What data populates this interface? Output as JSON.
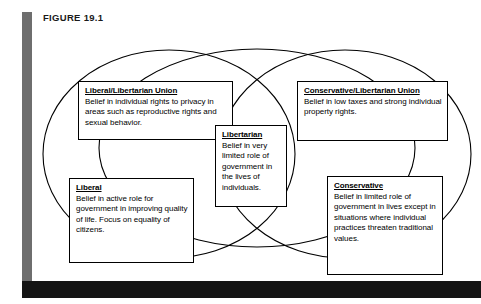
{
  "plate": {
    "figure_label": "FIGURE 19.1",
    "left_rule_color": "#6e6e6e",
    "bottom_band_color": "#141414",
    "stroke_color": "#000000",
    "background_color": "#ffffff"
  },
  "diagram": {
    "type": "venn",
    "ellipse_count": 3,
    "ellipses": [
      {
        "name": "liberal-ellipse",
        "cx": 136,
        "cy": 128,
        "rx": 126,
        "ry": 104
      },
      {
        "name": "libertarian-ellipse",
        "cx": 224,
        "cy": 122,
        "rx": 158,
        "ry": 99
      },
      {
        "name": "conservative-ellipse",
        "cx": 312,
        "cy": 128,
        "rx": 126,
        "ry": 104
      }
    ],
    "boxes": [
      {
        "id": "liberal-libertarian-union",
        "title": "Liberal/Libertarian Union",
        "body": "Belief in individual rights to privacy in areas such as reproductive rights and sexual behavior."
      },
      {
        "id": "conservative-libertarian-union",
        "title": "Conservative/Libertarian Union",
        "body": "Belief in low taxes and strong individual property rights."
      },
      {
        "id": "libertarian",
        "title": "Libertarian",
        "body": "Belief in very limited role of government in the lives of individuals."
      },
      {
        "id": "liberal",
        "title": "Liberal",
        "body": "Belief in active role for government in improving quality of life. Focus on equality of citizens."
      },
      {
        "id": "conservative",
        "title": "Conservative",
        "body": "Belief in limited role of government in lives except in situations where individual practices threaten traditional values."
      }
    ]
  }
}
